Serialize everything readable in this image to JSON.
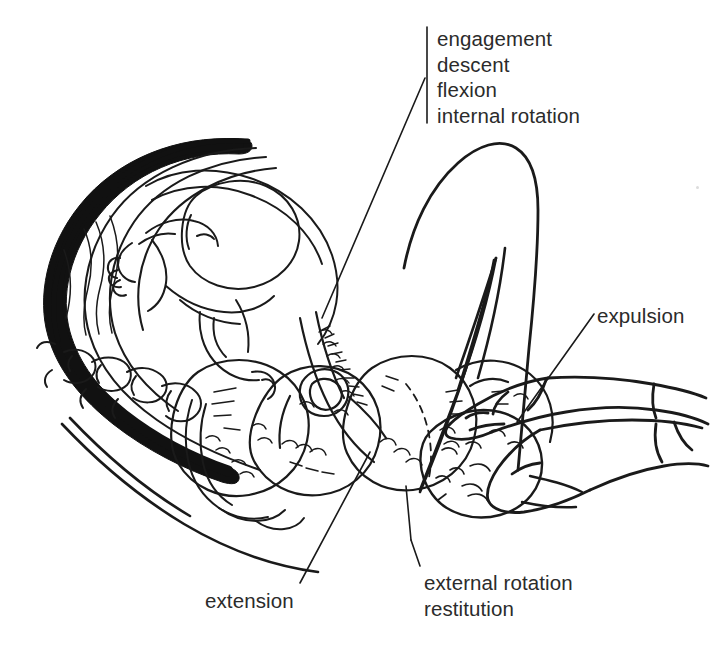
{
  "figure": {
    "background_color": "#ffffff",
    "ink_color": "#1a1a1a",
    "text_color": "#2b2b2b",
    "width": 716,
    "height": 661
  },
  "labels": {
    "first_stage": {
      "name": "cardinal-movements-label",
      "lines": [
        "engagement",
        "descent",
        "flexion",
        "internal rotation"
      ],
      "bracket": true
    },
    "expulsion": {
      "name": "expulsion-label",
      "lines": [
        "expulsion"
      ]
    },
    "extension": {
      "name": "extension-label",
      "lines": [
        "extension"
      ]
    },
    "external_rotation": {
      "name": "external-rotation-label",
      "lines": [
        "external rotation",
        "restitution"
      ]
    }
  },
  "anatomy": {
    "parts": [
      "placenta",
      "uterus",
      "fetus-in-utero",
      "maternal-spine",
      "sacrum",
      "maternal-back",
      "maternal-thigh",
      "maternal-leg",
      "fetal-head-descent-positions",
      "delivered-fetal-head",
      "clinician-upper-hand",
      "clinician-lower-hand"
    ]
  }
}
